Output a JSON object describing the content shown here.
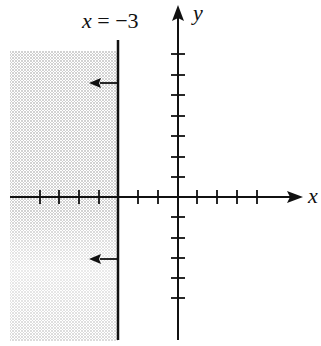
{
  "diagram": {
    "boundary_label": {
      "var": "x",
      "text": " = −3"
    },
    "x_axis_label": "x",
    "y_axis_label": "y",
    "boundary_x": -3,
    "shaded_side": "left",
    "boundary_style": "solid",
    "x_ticks": [
      -7,
      -6,
      -5,
      -4,
      -3,
      -2,
      -1,
      1,
      2,
      3,
      4
    ],
    "y_ticks": [
      -5,
      -4,
      -3,
      -2,
      -1,
      1,
      2,
      3,
      4,
      5,
      6,
      7
    ],
    "arrows": [
      {
        "direction": "left",
        "y": 6
      },
      {
        "direction": "left",
        "y": -3
      }
    ],
    "colors": {
      "axis": "#111111",
      "shade": "#9a9a9a"
    }
  }
}
